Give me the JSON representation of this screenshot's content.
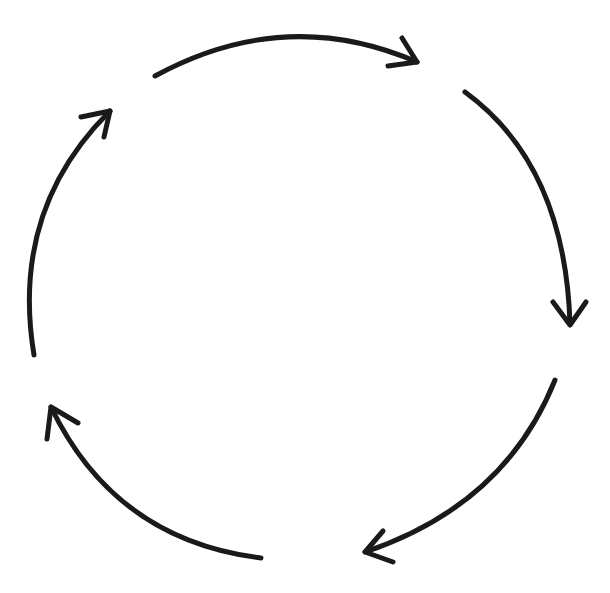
{
  "diagram": {
    "type": "cycle",
    "direction": "clockwise",
    "arrow_count": 5,
    "stroke_color": "#1a1a1a",
    "background_color": "#ffffff",
    "stroke_width": 5,
    "arrows": [
      {
        "id": "top",
        "from": "top-left",
        "to": "top-right"
      },
      {
        "id": "right",
        "from": "top-right",
        "to": "right"
      },
      {
        "id": "bottom-right",
        "from": "right",
        "to": "bottom"
      },
      {
        "id": "bottom-left",
        "from": "bottom",
        "to": "left"
      },
      {
        "id": "left",
        "from": "left",
        "to": "top-left"
      }
    ]
  }
}
